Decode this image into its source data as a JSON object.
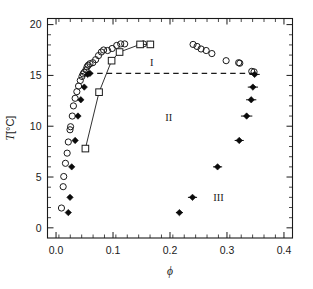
{
  "chart_data": {
    "type": "scatter",
    "title": "",
    "xlabel": "ϕ",
    "ylabel": "T [°C]",
    "xlim": [
      -0.015,
      0.415
    ],
    "ylim": [
      -1.0,
      20.6
    ],
    "xticks": [
      0.0,
      0.1,
      0.2,
      0.3,
      0.4
    ],
    "xticklabels": [
      "0.0",
      "0.1",
      "0.2",
      "0.3",
      "0.4"
    ],
    "yticks": [
      0,
      5,
      10,
      15,
      20
    ],
    "yticklabels": [
      "0",
      "5",
      "10",
      "15",
      "20"
    ],
    "x_minor_step": 0.02,
    "y_minor_step": 1,
    "grid": false,
    "legend_position": "none",
    "annotations": [
      {
        "text": "I",
        "x": 0.168,
        "y": 16.35
      },
      {
        "text": "II",
        "x": 0.198,
        "y": 10.9
      },
      {
        "text": "III",
        "x": 0.285,
        "y": 3.0
      }
    ],
    "series": [
      {
        "name": "cloud-point-open-circles",
        "marker": "open-circle",
        "points": [
          [
            0.0095,
            1.95
          ],
          [
            0.0125,
            4.05
          ],
          [
            0.0135,
            5.05
          ],
          [
            0.0165,
            6.35
          ],
          [
            0.0195,
            7.35
          ],
          [
            0.0215,
            8.45
          ],
          [
            0.0245,
            9.65
          ],
          [
            0.0255,
            9.95
          ],
          [
            0.0285,
            11.0
          ],
          [
            0.0305,
            12.0
          ],
          [
            0.0335,
            12.75
          ],
          [
            0.0365,
            13.4
          ],
          [
            0.0395,
            13.95
          ],
          [
            0.0425,
            14.5
          ],
          [
            0.0455,
            14.9
          ],
          [
            0.0475,
            15.15
          ],
          [
            0.0495,
            15.3
          ],
          [
            0.0525,
            15.55
          ],
          [
            0.0545,
            15.85
          ],
          [
            0.0565,
            16.0
          ],
          [
            0.0595,
            16.15
          ],
          [
            0.0645,
            16.25
          ],
          [
            0.0695,
            16.55
          ],
          [
            0.0745,
            16.95
          ],
          [
            0.0795,
            17.3
          ],
          [
            0.0835,
            17.5
          ],
          [
            0.0905,
            17.45
          ],
          [
            0.0985,
            17.65
          ],
          [
            0.1065,
            17.95
          ],
          [
            0.1135,
            18.1
          ],
          [
            0.1205,
            18.1
          ],
          [
            0.1475,
            18.05
          ],
          [
            0.1535,
            18.1
          ],
          [
            0.1655,
            18.05
          ],
          [
            0.2405,
            18.05
          ],
          [
            0.2475,
            17.85
          ],
          [
            0.2545,
            17.6
          ],
          [
            0.2635,
            17.45
          ],
          [
            0.2735,
            17.15
          ],
          [
            0.2985,
            16.45
          ],
          [
            0.3205,
            16.25
          ],
          [
            0.3225,
            16.2
          ],
          [
            0.3435,
            15.4
          ],
          [
            0.3475,
            15.35
          ]
        ]
      },
      {
        "name": "gel-point-filled-diamonds-left",
        "marker": "filled-diamond",
        "points": [
          [
            0.0215,
            1.5
          ],
          [
            0.0245,
            3.0
          ],
          [
            0.0275,
            6.0
          ],
          [
            0.0335,
            8.6
          ],
          [
            0.0385,
            11.0
          ],
          [
            0.0435,
            12.6
          ],
          [
            0.0495,
            13.85
          ],
          [
            0.0555,
            15.1
          ],
          [
            0.0595,
            15.2
          ]
        ]
      },
      {
        "name": "coexistence-filled-diamonds-right",
        "marker": "filled-diamond-errorbar",
        "points": [
          [
            0.2165,
            1.5
          ],
          [
            0.2395,
            3.0
          ],
          [
            0.2835,
            6.0
          ],
          [
            0.3215,
            8.6
          ],
          [
            0.3345,
            11.0
          ],
          [
            0.3425,
            12.6
          ],
          [
            0.3455,
            13.85
          ],
          [
            0.3485,
            15.1
          ]
        ],
        "xerr": [
          0.006,
          0.008,
          0.008,
          0.008,
          0.01,
          0.009,
          0.009,
          0.009
        ]
      },
      {
        "name": "boundary-open-squares",
        "marker": "open-square",
        "points": [
          [
            0.0515,
            7.8
          ],
          [
            0.0755,
            13.35
          ],
          [
            0.0975,
            16.45
          ],
          [
            0.1115,
            17.3
          ],
          [
            0.1475,
            18.05
          ],
          [
            0.1655,
            18.05
          ]
        ],
        "connected": true
      }
    ],
    "dashed_tie_line": {
      "name": "tie-line",
      "y": 15.2,
      "x_start": 0.0555,
      "x_end": 0.3485
    }
  },
  "axes": {
    "x_title": "ϕ",
    "y_title_variable": "T",
    "y_title_units": " [°C]"
  }
}
